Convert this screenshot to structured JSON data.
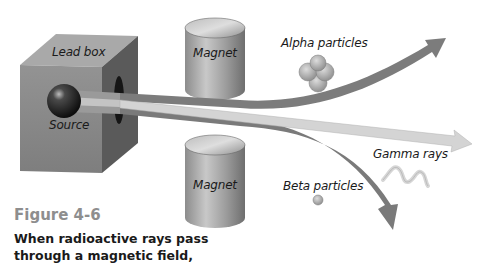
{
  "diagram": {
    "labels": {
      "lead_box": "Lead box",
      "source": "Source",
      "magnet_top": "Magnet",
      "magnet_bottom": "Magnet",
      "alpha": "Alpha particles",
      "gamma": "Gamma rays",
      "beta": "Beta  particles"
    },
    "colors": {
      "beam_dark": "#7a7a7a",
      "beam_light": "#cfcfcf",
      "box_front": "#8a8a8a",
      "box_side": "#555555",
      "box_top": "#a8a8a8",
      "magnet": "#a0a0a0"
    }
  },
  "figure": {
    "title": "Figure 4-6",
    "caption_lines": [
      "When radioactive rays pass",
      "through a magnetic field,"
    ]
  }
}
